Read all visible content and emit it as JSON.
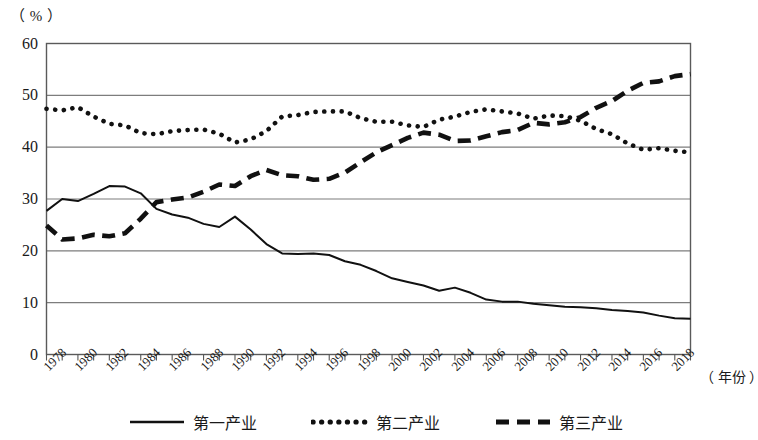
{
  "unit_label": "（ % ）",
  "xaxis_title": "（ 年份 ）",
  "axis": {
    "y_ticks": [
      "0",
      "10",
      "20",
      "30",
      "40",
      "50",
      "60"
    ],
    "x_ticks": [
      "1978",
      "1980",
      "1982",
      "1984",
      "1986",
      "1988",
      "1990",
      "1992",
      "1994",
      "1996",
      "1998",
      "2000",
      "2002",
      "2004",
      "2006",
      "2008",
      "2010",
      "2012",
      "2014",
      "2016",
      "2018"
    ]
  },
  "legend": {
    "items": [
      {
        "label": "第一产业",
        "style": "solid",
        "color": "#111111"
      },
      {
        "label": "第二产业",
        "style": "dotted",
        "color": "#111111"
      },
      {
        "label": "第三产业",
        "style": "dashed",
        "color": "#111111"
      }
    ]
  },
  "chart_data": {
    "type": "line",
    "title": "",
    "xlabel": "（ 年份 ）",
    "ylabel": "（ % ）",
    "xlim": [
      1978,
      2019
    ],
    "ylim": [
      0,
      60
    ],
    "grid": true,
    "legend_position": "bottom",
    "x": [
      1978,
      1979,
      1980,
      1981,
      1982,
      1983,
      1984,
      1985,
      1986,
      1987,
      1988,
      1989,
      1990,
      1991,
      1992,
      1993,
      1994,
      1995,
      1996,
      1997,
      1998,
      1999,
      2000,
      2001,
      2002,
      2003,
      2004,
      2005,
      2006,
      2007,
      2008,
      2009,
      2010,
      2011,
      2012,
      2013,
      2014,
      2015,
      2016,
      2017,
      2018,
      2019
    ],
    "series": [
      {
        "name": "第一产业",
        "style": "solid",
        "values": [
          27.7,
          30.0,
          29.6,
          31.0,
          32.5,
          32.4,
          31.1,
          28.1,
          27.0,
          26.4,
          25.2,
          24.6,
          26.6,
          24.1,
          21.3,
          19.5,
          19.4,
          19.5,
          19.2,
          18.0,
          17.3,
          16.1,
          14.7,
          14.0,
          13.3,
          12.3,
          12.9,
          11.9,
          10.6,
          10.2,
          10.2,
          9.8,
          9.5,
          9.2,
          9.1,
          8.9,
          8.6,
          8.4,
          8.1,
          7.5,
          7.0,
          6.9
        ]
      },
      {
        "name": "第二产业",
        "style": "dotted",
        "values": [
          47.4,
          47.1,
          47.7,
          45.9,
          44.5,
          44.2,
          42.7,
          42.5,
          43.1,
          43.3,
          43.4,
          42.6,
          40.9,
          41.5,
          43.1,
          45.9,
          46.2,
          46.8,
          46.9,
          46.9,
          45.6,
          44.9,
          44.9,
          44.2,
          43.9,
          45.3,
          45.9,
          46.8,
          47.3,
          46.9,
          46.5,
          45.5,
          46.1,
          46.0,
          45.1,
          43.5,
          42.5,
          40.7,
          39.5,
          39.8,
          39.3,
          39.0
        ]
      },
      {
        "name": "第三产业",
        "style": "dashed",
        "values": [
          24.9,
          22.2,
          22.4,
          23.1,
          22.8,
          23.4,
          26.2,
          29.4,
          29.9,
          30.3,
          31.4,
          32.8,
          32.5,
          34.4,
          35.6,
          34.6,
          34.4,
          33.7,
          33.9,
          35.1,
          37.1,
          39.0,
          40.4,
          41.8,
          42.8,
          42.4,
          41.2,
          41.3,
          42.1,
          42.9,
          43.3,
          44.7,
          44.4,
          44.8,
          45.8,
          47.6,
          48.9,
          50.9,
          52.4,
          52.7,
          53.7,
          54.1
        ]
      }
    ]
  }
}
